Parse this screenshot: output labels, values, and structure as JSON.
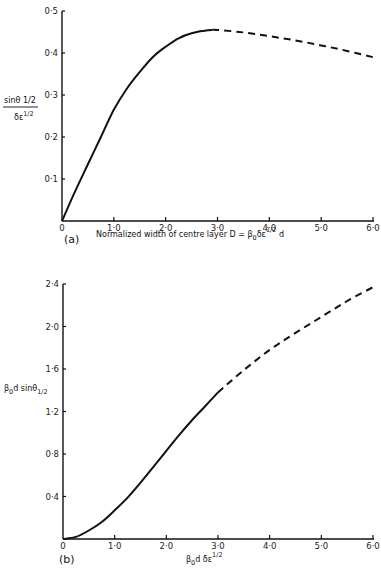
{
  "chart_data": [
    {
      "type": "line",
      "panel_label": "(a)",
      "xlabel": "Normalized width of centre layer D = β₀δε^1/2 d",
      "xlabel_parts": {
        "main": "Normalized width of centre layer D = β",
        "sub": "0",
        "mid": "δε",
        "sup": "1/2",
        "end": " d"
      },
      "ylabel": {
        "numerator": "sin θ 1/2",
        "denominator": "δε^1/2",
        "num_main": "sinθ 1/2",
        "den_main": "δε",
        "den_sup": "1/2"
      },
      "xlim": [
        0,
        6.0
      ],
      "ylim": [
        0,
        0.5
      ],
      "x_ticks": [
        0,
        1.0,
        2.0,
        3.0,
        4.0,
        5.0,
        6.0
      ],
      "x_tick_labels": [
        "0",
        "1·0",
        "2·0",
        "3·0",
        "4·0",
        "5·0",
        "6·0"
      ],
      "y_ticks": [
        0.1,
        0.2,
        0.3,
        0.4,
        0.5
      ],
      "y_tick_labels": [
        "0·1",
        "0·2",
        "0·3",
        "0·4",
        "0·5"
      ],
      "grid": false,
      "series": [
        {
          "name": "solid",
          "style": "solid",
          "x": [
            0,
            0.25,
            0.5,
            0.75,
            1.0,
            1.25,
            1.5,
            1.75,
            2.0,
            2.25,
            2.5,
            2.75,
            2.9
          ],
          "y": [
            0,
            0.07,
            0.135,
            0.2,
            0.265,
            0.315,
            0.355,
            0.39,
            0.415,
            0.435,
            0.447,
            0.453,
            0.455
          ]
        },
        {
          "name": "dashed",
          "style": "dashed",
          "x": [
            2.9,
            3.0,
            3.5,
            4.0,
            4.5,
            5.0,
            5.5,
            6.0
          ],
          "y": [
            0.455,
            0.455,
            0.449,
            0.44,
            0.43,
            0.418,
            0.405,
            0.39
          ]
        }
      ]
    },
    {
      "type": "line",
      "panel_label": "(b)",
      "xlabel": "β₀d δε^1/2",
      "xlabel_parts": {
        "main": "β",
        "sub": "0",
        "mid": "d δε",
        "sup": "1/2"
      },
      "ylabel": {
        "text": "β₀d sinθ1/2",
        "main": "β",
        "sub": "0",
        "mid": "d  sinθ",
        "sub2": "1/2"
      },
      "xlim": [
        0,
        6.0
      ],
      "ylim": [
        0,
        2.4
      ],
      "x_ticks": [
        0,
        1.0,
        2.0,
        3.0,
        4.0,
        5.0,
        6.0
      ],
      "x_tick_labels": [
        "0",
        "1·0",
        "2·0",
        "3·0",
        "4·0",
        "5·0",
        "6·0"
      ],
      "y_ticks": [
        0.4,
        0.8,
        1.2,
        1.6,
        2.0,
        2.4
      ],
      "y_tick_labels": [
        "0·4",
        "0·8",
        "1·2",
        "1·6",
        "2·0",
        "2·4"
      ],
      "grid": false,
      "series": [
        {
          "name": "solid",
          "style": "solid",
          "x": [
            0,
            0.25,
            0.5,
            0.75,
            1.0,
            1.25,
            1.5,
            1.75,
            2.0,
            2.25,
            2.5,
            2.75,
            3.0
          ],
          "y": [
            0,
            0.02,
            0.08,
            0.16,
            0.27,
            0.39,
            0.53,
            0.68,
            0.83,
            0.98,
            1.12,
            1.25,
            1.38
          ]
        },
        {
          "name": "dashed",
          "style": "dashed",
          "x": [
            3.0,
            3.5,
            4.0,
            4.5,
            5.0,
            5.5,
            6.0
          ],
          "y": [
            1.38,
            1.59,
            1.78,
            1.94,
            2.09,
            2.24,
            2.37
          ]
        }
      ]
    }
  ]
}
